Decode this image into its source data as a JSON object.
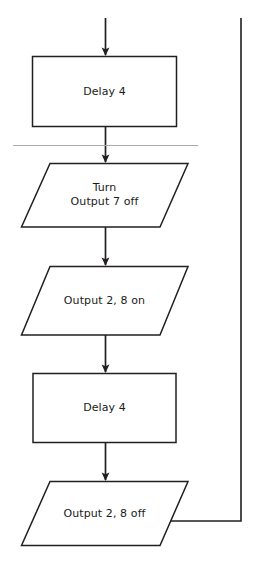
{
  "diagram": {
    "type": "flowchart",
    "title": "",
    "background_color": "#ffffff",
    "stroke_color": "#231f20",
    "divider_color": "#a7a9ac",
    "text_color": "#1a1a1a",
    "nodes": [
      {
        "id": "delay-4-top",
        "shape": "rectangle",
        "label": "Delay 4",
        "lines": [
          "Delay 4"
        ]
      },
      {
        "id": "turn-output-7-off",
        "shape": "parallelogram",
        "label": "Turn Output 7 off",
        "lines": [
          "Turn",
          "Output 7 off"
        ]
      },
      {
        "id": "output-2-8-on",
        "shape": "parallelogram",
        "label": "Output 2, 8 on",
        "lines": [
          "Output 2, 8 on"
        ]
      },
      {
        "id": "delay-4-bottom",
        "shape": "rectangle",
        "label": "Delay 4",
        "lines": [
          "Delay 4"
        ]
      },
      {
        "id": "output-2-8-off",
        "shape": "parallelogram",
        "label": "Output 2, 8 off",
        "lines": [
          "Output 2, 8 off"
        ]
      }
    ],
    "connectors": [
      {
        "id": "entry-arrow",
        "from": "top-edge",
        "to": "delay-4-top",
        "arrow": true
      },
      {
        "id": "delay-top-to-turn",
        "from": "delay-4-top",
        "to": "turn-output-7-off",
        "arrow": true
      },
      {
        "id": "turn-to-output-on",
        "from": "turn-output-7-off",
        "to": "output-2-8-on",
        "arrow": true
      },
      {
        "id": "output-on-to-delay",
        "from": "output-2-8-on",
        "to": "delay-4-bottom",
        "arrow": true
      },
      {
        "id": "delay-to-output-off",
        "from": "delay-4-bottom",
        "to": "output-2-8-off",
        "arrow": true
      },
      {
        "id": "loop-back",
        "from": "output-2-8-off",
        "to": "top-edge",
        "arrow": false
      }
    ],
    "divider": {
      "id": "page-divider",
      "orientation": "horizontal"
    }
  }
}
